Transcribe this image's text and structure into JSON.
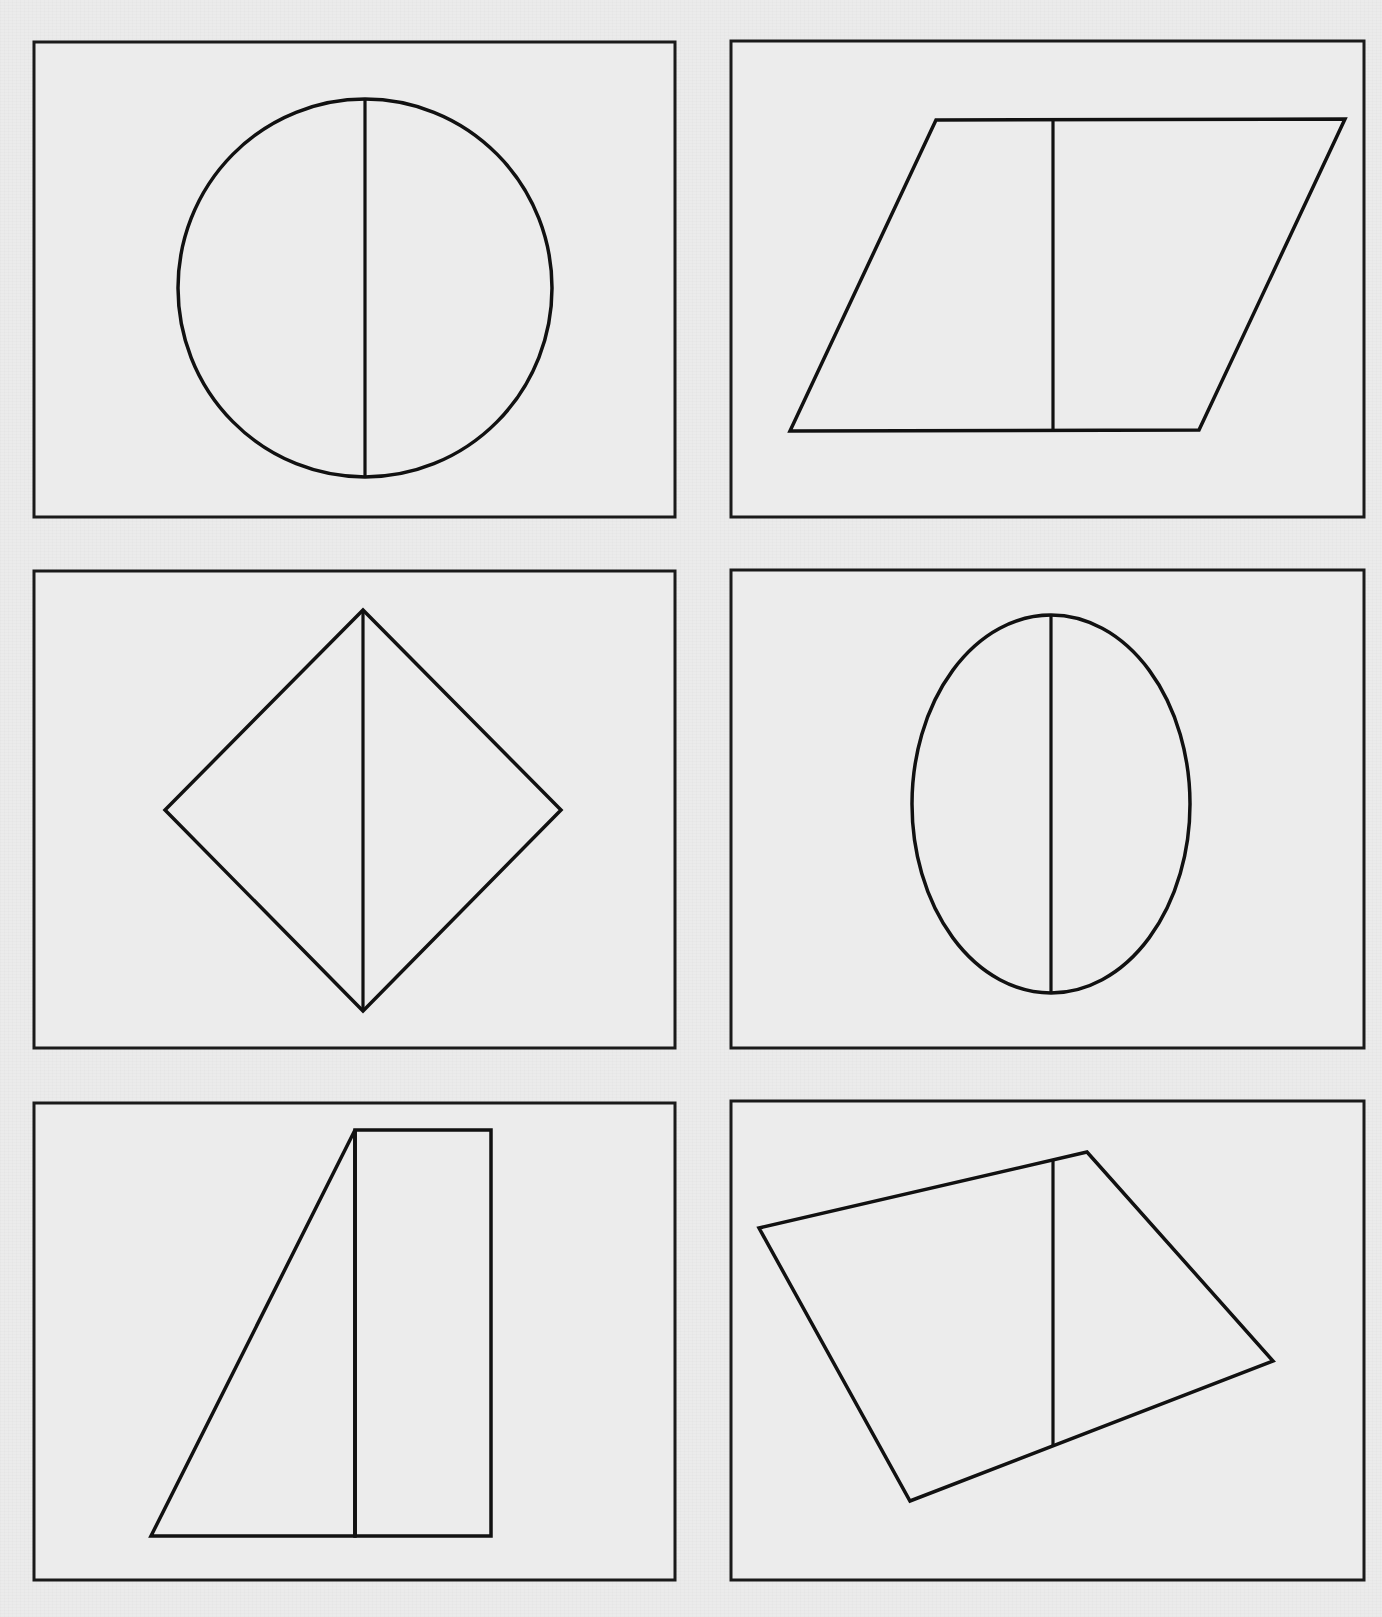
{
  "document": {
    "background": "#ebebeb",
    "ink_color": "#111111",
    "layout": {
      "rows": 3,
      "columns": 2
    }
  },
  "panels": [
    {
      "id": "panel-1",
      "position": "row1-left",
      "frame": {
        "x": 34,
        "y": 42,
        "w": 641,
        "h": 475
      },
      "shape": {
        "kind": "circle",
        "cx": 365,
        "cy": 288,
        "rx": 187,
        "ry": 189
      },
      "divider": {
        "x1": 365,
        "y1": 99,
        "x2": 365,
        "y2": 477
      }
    },
    {
      "id": "panel-2",
      "position": "row1-right",
      "frame": {
        "x": 731,
        "y": 41,
        "w": 633,
        "h": 476
      },
      "shape": {
        "kind": "parallelogram",
        "points": "936,120 1345,119 1199,430 790,431"
      },
      "divider": {
        "x1": 1053,
        "y1": 120,
        "x2": 1053,
        "y2": 431
      }
    },
    {
      "id": "panel-3",
      "position": "row2-left",
      "frame": {
        "x": 34,
        "y": 571,
        "w": 641,
        "h": 477
      },
      "shape": {
        "kind": "diamond",
        "points": "363,610 561,810 363,1011 165,810"
      },
      "divider": {
        "x1": 363,
        "y1": 610,
        "x2": 363,
        "y2": 1011
      }
    },
    {
      "id": "panel-4",
      "position": "row2-right",
      "frame": {
        "x": 731,
        "y": 570,
        "w": 633,
        "h": 478
      },
      "shape": {
        "kind": "ellipse",
        "cx": 1051,
        "cy": 804,
        "rx": 139,
        "ry": 189
      },
      "divider": {
        "x1": 1051,
        "y1": 615,
        "x2": 1051,
        "y2": 993
      }
    },
    {
      "id": "panel-5",
      "position": "row3-left",
      "frame": {
        "x": 34,
        "y": 1103,
        "w": 641,
        "h": 477
      },
      "shape": {
        "kind": "triangle-and-rectangle",
        "triangle": "355,1130 355,1536 151,1536",
        "rectangle": {
          "x": 355,
          "y": 1130,
          "w": 136,
          "h": 406
        }
      },
      "divider": {
        "x1": 355,
        "y1": 1130,
        "x2": 355,
        "y2": 1536
      }
    },
    {
      "id": "panel-6",
      "position": "row3-right",
      "frame": {
        "x": 731,
        "y": 1101,
        "w": 633,
        "h": 479
      },
      "shape": {
        "kind": "irregular-quadrilateral",
        "points": "759,1228 1087,1152 1273,1361 910,1501"
      },
      "divider": {
        "x1": 1053,
        "y1": 1161,
        "x2": 1053,
        "y2": 1446
      }
    }
  ]
}
